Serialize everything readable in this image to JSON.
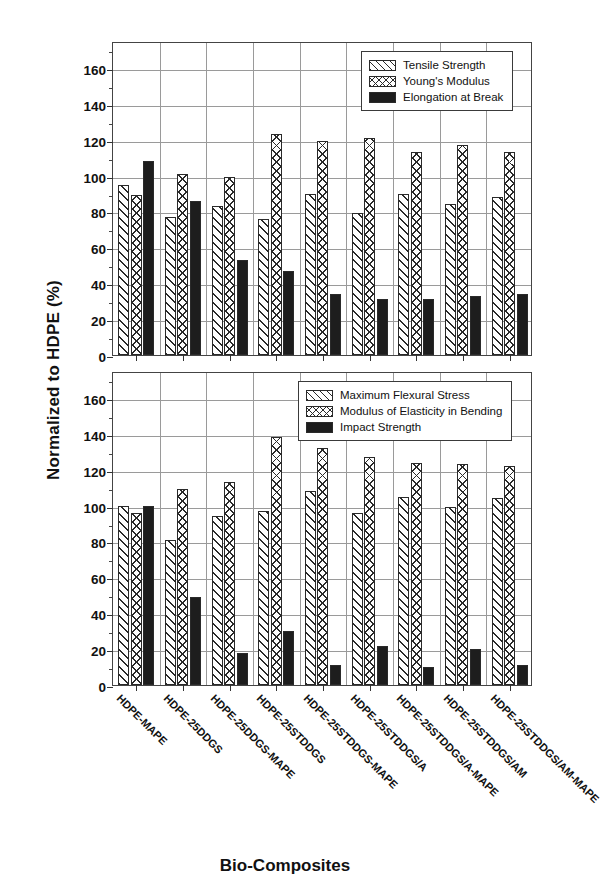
{
  "axis": {
    "ylabel": "Normalized to HDPE (%)",
    "xlabel": "Bio-Composites",
    "yticks": [
      0,
      20,
      40,
      60,
      80,
      100,
      120,
      140,
      160
    ],
    "ylim": [
      0,
      175
    ]
  },
  "categories": [
    "HDPE-MAPE",
    "HDPE-25DDGS",
    "HDPE-25DDGS-MAPE",
    "HDPE-25STDDGS",
    "HDPE-25STDDGS-MAPE",
    "HDPE-25STDDGS/A",
    "HDPE-25STDDGS/A-MAPE",
    "HDPE-25STDDGS/AM",
    "HDPE-25STDDGS/AM-MAPE"
  ],
  "chart_data": [
    {
      "type": "bar",
      "panel": "top",
      "title": "",
      "xlabel": "Bio-Composites",
      "ylabel": "Normalized to HDPE (%)",
      "ylim": [
        0,
        175
      ],
      "yticks": [
        0,
        20,
        40,
        60,
        80,
        100,
        120,
        140,
        160
      ],
      "grid": true,
      "legend_position": "top-right",
      "categories": [
        "HDPE-MAPE",
        "HDPE-25DDGS",
        "HDPE-25DDGS-MAPE",
        "HDPE-25STDDGS",
        "HDPE-25STDDGS-MAPE",
        "HDPE-25STDDGS/A",
        "HDPE-25STDDGS/A-MAPE",
        "HDPE-25STDDGS/AM",
        "HDPE-25STDDGS/AM-MAPE"
      ],
      "series": [
        {
          "name": "Tensile Strength",
          "pattern": "hatch-diag",
          "values": [
            95,
            77,
            83,
            76,
            90,
            79,
            90,
            84,
            88
          ]
        },
        {
          "name": "Young's Modulus",
          "pattern": "hatch-cross",
          "values": [
            89,
            101,
            99,
            123,
            119,
            121,
            113,
            117,
            113
          ]
        },
        {
          "name": "Elongation at Break",
          "pattern": "solid",
          "values": [
            108,
            86,
            53,
            47,
            34,
            31,
            31,
            33,
            34
          ]
        }
      ]
    },
    {
      "type": "bar",
      "panel": "bottom",
      "title": "",
      "xlabel": "Bio-Composites",
      "ylabel": "Normalized to HDPE (%)",
      "ylim": [
        0,
        175
      ],
      "yticks": [
        0,
        20,
        40,
        60,
        80,
        100,
        120,
        140,
        160
      ],
      "grid": true,
      "legend_position": "top-right",
      "categories": [
        "HDPE-MAPE",
        "HDPE-25DDGS",
        "HDPE-25DDGS-MAPE",
        "HDPE-25STDDGS",
        "HDPE-25STDDGS-MAPE",
        "HDPE-25STDDGS/A",
        "HDPE-25STDDGS/A-MAPE",
        "HDPE-25STDDGS/AM",
        "HDPE-25STDDGS/AM-MAPE"
      ],
      "series": [
        {
          "name": "Maximum Flexural Stress",
          "pattern": "hatch-diag",
          "values": [
            100,
            81,
            94,
            97,
            108,
            96,
            105,
            99,
            104
          ]
        },
        {
          "name": "Modulus of Elasticity in Bending",
          "pattern": "hatch-cross",
          "values": [
            96,
            109,
            113,
            138,
            132,
            127,
            124,
            123,
            122
          ]
        },
        {
          "name": "Impact Strength",
          "pattern": "solid",
          "values": [
            100,
            49,
            18,
            30,
            11,
            22,
            10,
            20,
            11
          ]
        }
      ]
    }
  ]
}
